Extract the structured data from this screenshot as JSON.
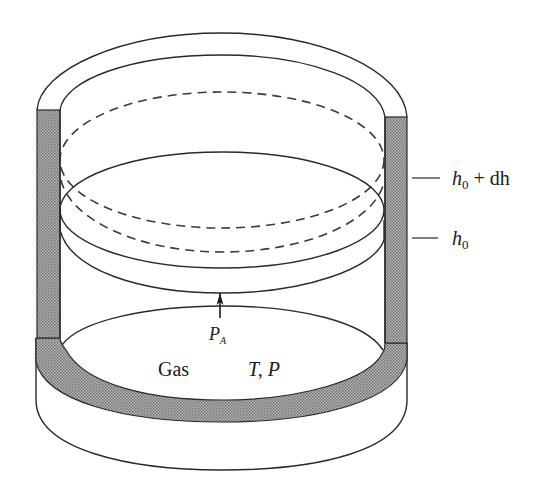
{
  "figure": {
    "colors": {
      "line": "#2a2a2a",
      "wall_fill": "#9a9a9a",
      "background": "#ffffff"
    }
  },
  "labels": {
    "height_upper": {
      "base": "h",
      "sub": "0",
      "rest": " + dh"
    },
    "height_lower": {
      "base": "h",
      "sub": "0"
    },
    "pressure_arrow": {
      "base": "P",
      "sub": "A"
    },
    "gas": "Gas",
    "state": "T, P"
  },
  "elements": {
    "cylinder_wall": "insulated-wall",
    "piston_positions": [
      "initial piston (h0)",
      "displaced piston (h0 + dh)"
    ],
    "arrow": "pressure-arrow-up"
  }
}
